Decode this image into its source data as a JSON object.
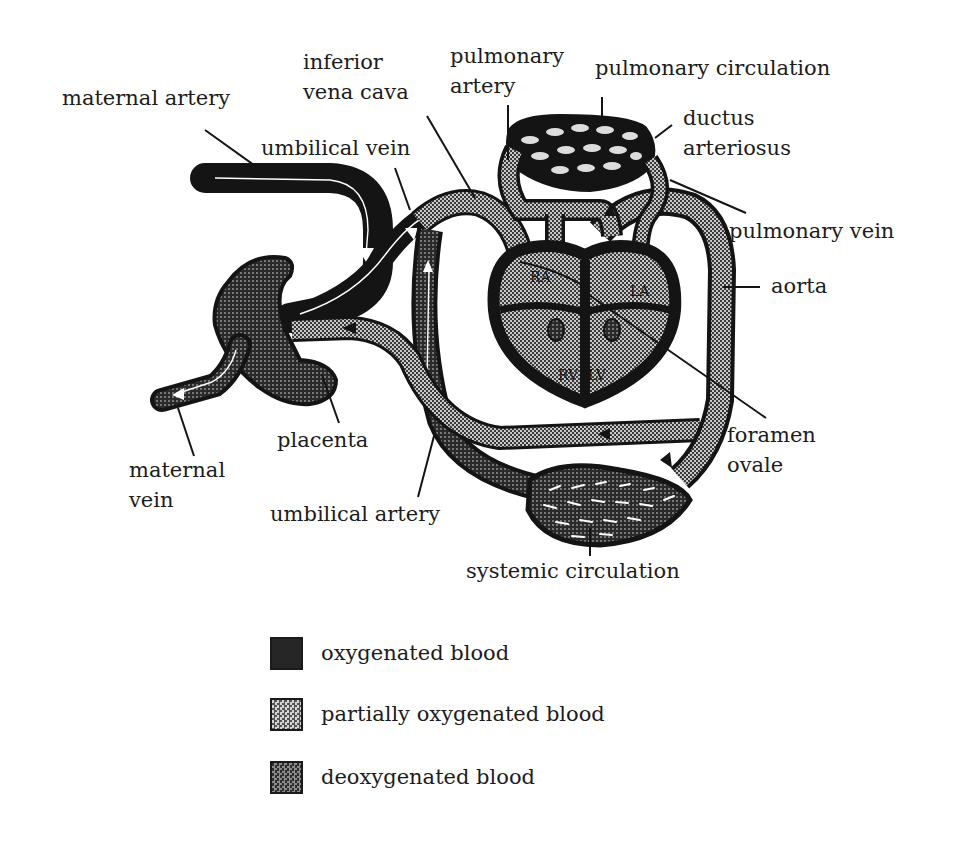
{
  "labels": {
    "maternal_artery": "maternal artery",
    "inferior_vena_cava_1": "inferior",
    "inferior_vena_cava_2": "vena cava",
    "pulmonary_artery_1": "pulmonary",
    "pulmonary_artery_2": "artery",
    "pulmonary_circulation": "pulmonary circulation",
    "umbilical_vein": "umbilical vein",
    "ductus_arteriosus_1": "ductus",
    "ductus_arteriosus_2": "arteriosus",
    "pulmonary_vein": "pulmonary vein",
    "aorta": "aorta",
    "placenta": "placenta",
    "maternal_vein_1": "maternal",
    "maternal_vein_2": "vein",
    "umbilical_artery": "umbilical artery",
    "foramen_ovale_1": "foramen",
    "foramen_ovale_2": "ovale",
    "systemic_circulation": "systemic circulation",
    "heart_RA": "RA",
    "heart_LA": "LA",
    "heart_RV": "RV",
    "heart_LV": "LV"
  },
  "legend": [
    {
      "label": "oxygenated blood",
      "pattern": "solid-dark",
      "color": "#1f1f1f"
    },
    {
      "label": "partially oxygenated blood",
      "pattern": "light-checker",
      "color": "#9a9a9a"
    },
    {
      "label": "deoxygenated blood",
      "pattern": "dark-checker",
      "color": "#4a4a4a"
    }
  ],
  "colors": {
    "oxygenated": "#1f1f1f",
    "partial": "#9a9a9a",
    "deoxygenated": "#4a4a4a",
    "outline": "#141414",
    "background": "#ffffff"
  }
}
